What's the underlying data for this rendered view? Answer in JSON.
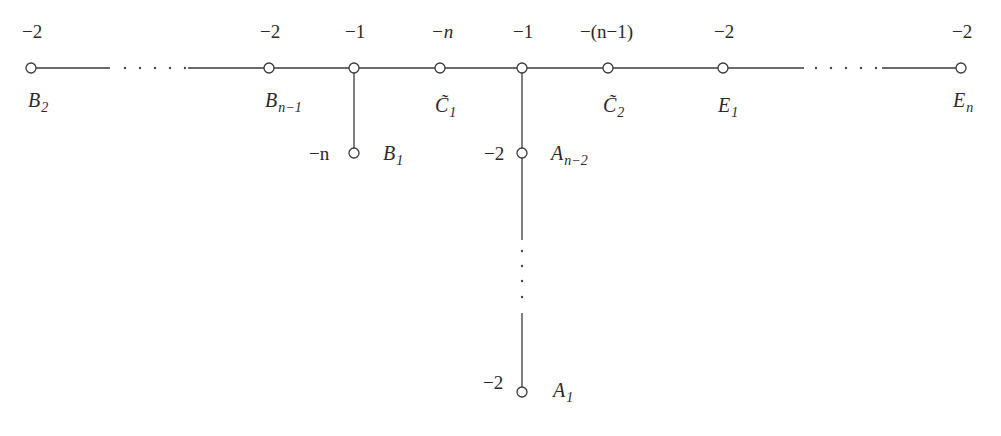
{
  "diagram": {
    "type": "weighted dual graph",
    "nodes": [
      {
        "id": "B2",
        "label": "B",
        "sub": "2",
        "weight": "−2",
        "x": 31,
        "y": 68
      },
      {
        "id": "Bn-1",
        "label": "B",
        "sub": "n−1",
        "weight": "−2",
        "x": 269,
        "y": 68
      },
      {
        "id": "J1",
        "label": "",
        "sub": "",
        "weight": "−1",
        "x": 354,
        "y": 68
      },
      {
        "id": "C1",
        "label": "C̃",
        "sub": "1",
        "weight": "−n",
        "x": 440,
        "y": 68
      },
      {
        "id": "J2",
        "label": "",
        "sub": "",
        "weight": "−1",
        "x": 522,
        "y": 68
      },
      {
        "id": "C2",
        "label": "C̃",
        "sub": "2",
        "weight": "−(n−1)",
        "x": 608,
        "y": 68
      },
      {
        "id": "E1",
        "label": "E",
        "sub": "1",
        "weight": "−2",
        "x": 723,
        "y": 68
      },
      {
        "id": "En",
        "label": "E",
        "sub": "n",
        "weight": "−2",
        "x": 961,
        "y": 68
      },
      {
        "id": "B1",
        "label": "B",
        "sub": "1",
        "weight": "−n",
        "x": 354,
        "y": 153
      },
      {
        "id": "An-2",
        "label": "A",
        "sub": "n−2",
        "weight": "−2",
        "x": 522,
        "y": 153
      },
      {
        "id": "A1",
        "label": "A",
        "sub": "1",
        "weight": "−2",
        "x": 522,
        "y": 392
      }
    ],
    "edges": [
      [
        "B2",
        "…",
        "Bn-1"
      ],
      [
        "Bn-1",
        "J1"
      ],
      [
        "J1",
        "C1"
      ],
      [
        "C1",
        "J2"
      ],
      [
        "J2",
        "C2"
      ],
      [
        "C2",
        "E1"
      ],
      [
        "E1",
        "…",
        "En"
      ],
      [
        "J1",
        "B1"
      ],
      [
        "J2",
        "An-2"
      ],
      [
        "An-2",
        "…",
        "A1"
      ]
    ],
    "weights": {
      "B2": "−2",
      "Bn-1": "−2",
      "J1": "−1",
      "C1": "−n",
      "J2": "−1",
      "C2": "−(n−1)",
      "E1": "−2",
      "En": "−2",
      "B1": "−n",
      "An-2": "−2",
      "A1": "−2"
    },
    "labels": {
      "B2": {
        "main": "B",
        "sub": "2"
      },
      "Bn-1": {
        "main": "B",
        "sub": "n−1"
      },
      "C1": {
        "main": "C̃",
        "sub": "1"
      },
      "C2": {
        "main": "C̃",
        "sub": "2"
      },
      "E1": {
        "main": "E",
        "sub": "1"
      },
      "En": {
        "main": "E",
        "sub": "n"
      },
      "B1": {
        "main": "B",
        "sub": "1"
      },
      "An-2": {
        "main": "A",
        "sub": "n−2"
      },
      "A1": {
        "main": "A",
        "sub": "1"
      }
    }
  }
}
